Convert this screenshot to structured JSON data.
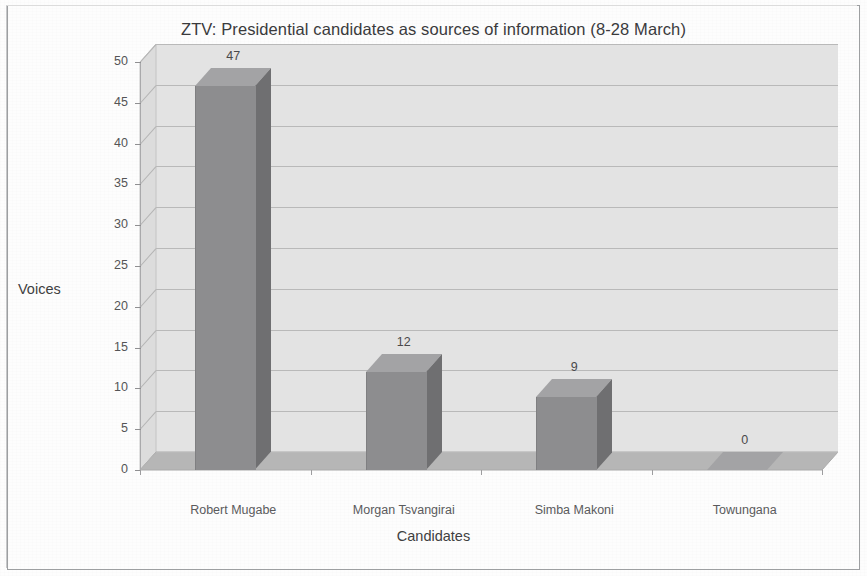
{
  "chart_data": {
    "type": "bar",
    "title": "ZTV: Presidential candidates as sources of information (8-28 March)",
    "xlabel": "Candidates",
    "ylabel": "Voices",
    "categories": [
      "Robert Mugabe",
      "Morgan Tsvangirai",
      "Simba Makoni",
      "Towungana"
    ],
    "values": [
      47,
      12,
      9,
      0
    ],
    "value_labels": [
      "47",
      "12",
      "9",
      "0"
    ],
    "ylim": [
      0,
      50
    ],
    "yticks": [
      0,
      5,
      10,
      15,
      20,
      25,
      30,
      35,
      40,
      45,
      50
    ],
    "ytick_labels": [
      "0",
      "5",
      "10",
      "15",
      "20",
      "25",
      "30",
      "35",
      "40",
      "45",
      "50"
    ],
    "grid": true,
    "legend": false,
    "style": "3d-column",
    "colors": {
      "bar_front": "#8d8d8f",
      "bar_side": "#6f6f71",
      "bar_top": "#a3a3a5",
      "plot_background": "#e3e3e3",
      "floor": "#b6b6b6",
      "left_wall": "#dcdcdc",
      "gridline": "#b9b9b9",
      "axis": "#a9a9ab",
      "text": "#3f3f41",
      "page_background": "#fdfdfd",
      "border": "#9d9fa1"
    }
  }
}
